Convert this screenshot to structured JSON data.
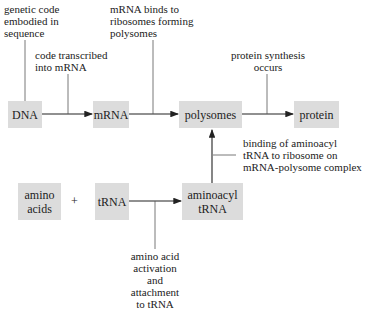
{
  "nodes": {
    "dna": "DNA",
    "mrna": "mRNA",
    "polysomes": "polysomes",
    "protein": "protein",
    "amino_acids_1": "amino",
    "amino_acids_2": "acids",
    "plus": "+",
    "trna": "tRNA",
    "aminoacyl_1": "aminoacyl",
    "aminoacyl_2": "tRNA"
  },
  "annotations": {
    "genetic_code": [
      "genetic code",
      "embodied in",
      "sequence"
    ],
    "transcription": [
      "code transcribed",
      "into mRNA"
    ],
    "mrna_binds": [
      "mRNA binds to",
      "ribosomes forming",
      "polysomes"
    ],
    "protein_synthesis": [
      "protein synthesis",
      "occurs"
    ],
    "binding_aminoacyl": [
      "binding of aminoacyl",
      "tRNA to ribosome on",
      "mRNA-polysome complex"
    ],
    "activation": [
      "amino acid",
      "activation",
      "and",
      "attachment",
      "to tRNA"
    ]
  },
  "colors": {
    "box_fill": "#dcdcdc",
    "line": "#222222",
    "leader": "#555555"
  }
}
